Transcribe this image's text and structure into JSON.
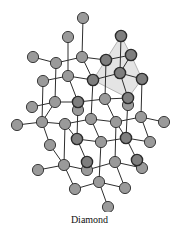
{
  "caption": "Diamond",
  "colors": {
    "atom_fill": "#9a9a9a",
    "atom_stroke": "#2a2a2a",
    "atom_highlight_fill": "#7e7e7e",
    "bond": "#2e2e2e",
    "tetrahedron_fill": "#e4e4e4",
    "tetrahedron_stroke": "#b5b5b5"
  },
  "tetrahedron": [
    [
      121,
      36
    ],
    [
      131,
      55
    ],
    [
      142,
      79
    ],
    [
      128,
      98
    ],
    [
      93,
      80
    ]
  ],
  "atoms": [
    {
      "x": 83,
      "y": 18
    },
    {
      "x": 68,
      "y": 37
    },
    {
      "x": 121,
      "y": 36,
      "h": 1
    },
    {
      "x": 33,
      "y": 57
    },
    {
      "x": 56,
      "y": 63
    },
    {
      "x": 82,
      "y": 57
    },
    {
      "x": 106,
      "y": 60,
      "h": 1
    },
    {
      "x": 131,
      "y": 55,
      "h": 1
    },
    {
      "x": 43,
      "y": 81
    },
    {
      "x": 68,
      "y": 76
    },
    {
      "x": 93,
      "y": 80,
      "h": 1
    },
    {
      "x": 120,
      "y": 73,
      "h": 1
    },
    {
      "x": 142,
      "y": 79,
      "h": 1
    },
    {
      "x": 32,
      "y": 107
    },
    {
      "x": 55,
      "y": 102
    },
    {
      "x": 78,
      "y": 110
    },
    {
      "x": 78,
      "y": 102,
      "h": 1
    },
    {
      "x": 105,
      "y": 99
    },
    {
      "x": 128,
      "y": 105
    },
    {
      "x": 128,
      "y": 98,
      "h": 1
    },
    {
      "x": 141,
      "y": 117
    },
    {
      "x": 17,
      "y": 125
    },
    {
      "x": 42,
      "y": 122
    },
    {
      "x": 65,
      "y": 124
    },
    {
      "x": 91,
      "y": 119
    },
    {
      "x": 116,
      "y": 122
    },
    {
      "x": 164,
      "y": 122
    },
    {
      "x": 50,
      "y": 145
    },
    {
      "x": 77,
      "y": 139,
      "h": 1
    },
    {
      "x": 101,
      "y": 142
    },
    {
      "x": 126,
      "y": 138,
      "h": 1
    },
    {
      "x": 150,
      "y": 142
    },
    {
      "x": 87,
      "y": 170
    },
    {
      "x": 87,
      "y": 162,
      "h": 1
    },
    {
      "x": 142,
      "y": 168
    },
    {
      "x": 137,
      "y": 160,
      "h": 1
    },
    {
      "x": 38,
      "y": 170
    },
    {
      "x": 64,
      "y": 165
    },
    {
      "x": 115,
      "y": 162
    },
    {
      "x": 75,
      "y": 189
    },
    {
      "x": 99,
      "y": 182
    },
    {
      "x": 125,
      "y": 188
    },
    {
      "x": 108,
      "y": 207
    }
  ],
  "bonds": [
    [
      83,
      18,
      82,
      57
    ],
    [
      68,
      37,
      68,
      76
    ],
    [
      121,
      36,
      120,
      73
    ],
    [
      33,
      57,
      56,
      63
    ],
    [
      56,
      63,
      82,
      57
    ],
    [
      82,
      57,
      106,
      60
    ],
    [
      106,
      60,
      131,
      55
    ],
    [
      82,
      57,
      93,
      80
    ],
    [
      56,
      63,
      55,
      102
    ],
    [
      106,
      60,
      105,
      99
    ],
    [
      131,
      55,
      120,
      73
    ],
    [
      43,
      81,
      68,
      76
    ],
    [
      68,
      76,
      93,
      80
    ],
    [
      93,
      80,
      120,
      73
    ],
    [
      120,
      73,
      142,
      79
    ],
    [
      68,
      76,
      78,
      102
    ],
    [
      120,
      73,
      128,
      98
    ],
    [
      93,
      80,
      91,
      119
    ],
    [
      142,
      79,
      141,
      117
    ],
    [
      32,
      107,
      55,
      102
    ],
    [
      55,
      102,
      78,
      102
    ],
    [
      78,
      102,
      105,
      99
    ],
    [
      105,
      99,
      128,
      98
    ],
    [
      55,
      102,
      42,
      122
    ],
    [
      105,
      99,
      116,
      122
    ],
    [
      43,
      81,
      42,
      122
    ],
    [
      17,
      125,
      42,
      122
    ],
    [
      42,
      122,
      65,
      124
    ],
    [
      65,
      124,
      91,
      119
    ],
    [
      91,
      119,
      116,
      122
    ],
    [
      116,
      122,
      141,
      117
    ],
    [
      141,
      117,
      164,
      122
    ],
    [
      65,
      124,
      77,
      139
    ],
    [
      116,
      122,
      126,
      138
    ],
    [
      42,
      122,
      50,
      145
    ],
    [
      91,
      119,
      101,
      142
    ],
    [
      141,
      117,
      150,
      142
    ],
    [
      77,
      139,
      101,
      142
    ],
    [
      101,
      142,
      126,
      138
    ],
    [
      126,
      138,
      150,
      142
    ],
    [
      77,
      139,
      87,
      162
    ],
    [
      126,
      138,
      137,
      160
    ],
    [
      78,
      102,
      77,
      139
    ],
    [
      128,
      98,
      126,
      138
    ],
    [
      101,
      142,
      99,
      182
    ],
    [
      116,
      122,
      115,
      162
    ],
    [
      38,
      170,
      64,
      165
    ],
    [
      64,
      165,
      87,
      170
    ],
    [
      87,
      170,
      115,
      162
    ],
    [
      115,
      162,
      142,
      168
    ],
    [
      50,
      145,
      64,
      165
    ],
    [
      64,
      165,
      75,
      189
    ],
    [
      115,
      162,
      125,
      188
    ],
    [
      99,
      182,
      75,
      189
    ],
    [
      99,
      182,
      125,
      188
    ],
    [
      99,
      182,
      108,
      207
    ],
    [
      65,
      124,
      64,
      165
    ]
  ]
}
